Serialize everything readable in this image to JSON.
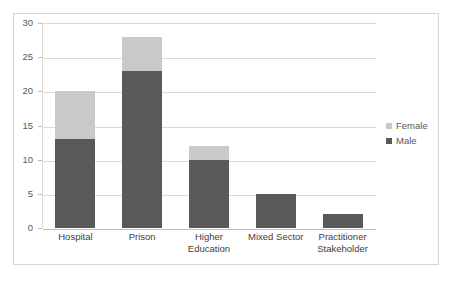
{
  "chart_data": {
    "type": "bar",
    "subtype": "stacked-bar-vertical",
    "title": "",
    "subtitle": "",
    "xlabel": "",
    "ylabel": "",
    "ylim": [
      0,
      30
    ],
    "y_ticks": [
      0,
      5,
      10,
      15,
      20,
      25,
      30
    ],
    "y_tick_labels": [
      "0",
      "5",
      "10",
      "15",
      "20",
      "25",
      "30"
    ],
    "grid": "horizontal",
    "legend_position": "right",
    "categories": [
      "Hospital",
      "Prison",
      "Higher Education",
      "Mixed Sector",
      "Practitioner Stakeholder"
    ],
    "category_label_lines": [
      [
        "Hospital"
      ],
      [
        "Prison"
      ],
      [
        "Higher",
        "Education"
      ],
      [
        "Mixed Sector"
      ],
      [
        "Practitioner",
        "Stakeholder"
      ]
    ],
    "series": [
      {
        "name": "Male",
        "color": "#595959",
        "values": [
          13,
          23,
          10,
          5,
          2
        ]
      },
      {
        "name": "Female",
        "color": "#c9c9c9",
        "values": [
          7,
          5,
          2,
          0,
          0
        ]
      }
    ],
    "stack_order_bottom_to_top": [
      "Male",
      "Female"
    ],
    "totals": [
      20,
      28,
      12,
      5,
      2
    ],
    "annotations": []
  },
  "legend": {
    "items": [
      {
        "label": "Female",
        "color": "#c9c9c9",
        "swatch": "square-icon"
      },
      {
        "label": "Male",
        "color": "#595959",
        "swatch": "square-icon"
      }
    ]
  },
  "colors": {
    "female": "#c9c9c9",
    "male": "#595959",
    "gridline": "#d9d9d9",
    "axis": "#bfbfbf",
    "frame": "#d6d6d6",
    "text": "#595959",
    "background": "#ffffff"
  }
}
